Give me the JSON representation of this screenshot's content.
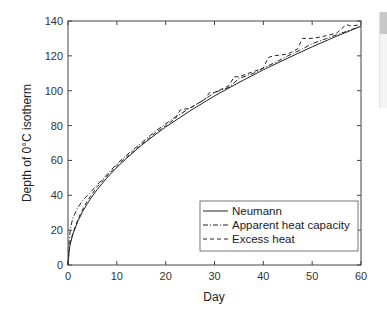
{
  "chart_data": {
    "type": "line",
    "title": "",
    "xlabel": "Day",
    "ylabel": "Depth of 0°C isotherm",
    "xlim": [
      0,
      60
    ],
    "ylim": [
      0,
      140
    ],
    "xticks": [
      0,
      10,
      20,
      30,
      40,
      50,
      60
    ],
    "yticks": [
      0,
      20,
      40,
      60,
      80,
      100,
      120,
      140
    ],
    "grid": false,
    "legend_position": "lower right",
    "series": [
      {
        "name": "Neumann",
        "style": "solid",
        "x": [
          0,
          0.25,
          0.5,
          1,
          2,
          3,
          4,
          5,
          6,
          8,
          10,
          12,
          15,
          18,
          20,
          25,
          30,
          35,
          40,
          45,
          50,
          55,
          60
        ],
        "y": [
          0,
          8.9,
          12.5,
          17.7,
          25,
          30.7,
          35.4,
          39.6,
          43.4,
          50.1,
          56,
          61.3,
          68.6,
          75.1,
          79.2,
          88.5,
          97,
          104.7,
          112,
          118.7,
          125.2,
          131.3,
          137
        ]
      },
      {
        "name": "Apparent heat capacity",
        "style": "dashdot",
        "x": [
          0,
          0.25,
          0.5,
          1,
          2,
          3,
          4,
          5,
          6,
          8,
          10,
          12,
          15,
          18,
          20,
          22,
          25,
          28,
          30,
          33,
          35,
          38,
          40,
          43,
          45,
          48,
          50,
          53,
          55,
          58,
          60
        ],
        "y": [
          0,
          14,
          21,
          27,
          33,
          37,
          40,
          43,
          46,
          52,
          58,
          63,
          70,
          77,
          81,
          85,
          90,
          95,
          99,
          102,
          107,
          110,
          113,
          117,
          120,
          124,
          127,
          130,
          132,
          135,
          137
        ]
      },
      {
        "name": "Excess heat",
        "style": "dashed",
        "x": [
          0,
          0.25,
          0.5,
          1,
          2,
          3,
          4,
          5,
          6,
          8,
          10,
          12,
          15,
          18,
          20,
          22,
          23,
          25,
          28,
          29,
          30,
          33,
          34,
          35,
          38,
          40,
          41,
          42,
          45,
          47,
          48,
          50,
          52,
          55,
          57,
          58,
          60
        ],
        "y": [
          0,
          9,
          13,
          18.5,
          26,
          32,
          37,
          41,
          45,
          51,
          57,
          62,
          69,
          76,
          80,
          84,
          89,
          90,
          95,
          99,
          99,
          103,
          108,
          108,
          111,
          113,
          119,
          120,
          121,
          124,
          130,
          130,
          131,
          133,
          138,
          137,
          138
        ]
      }
    ]
  },
  "axes": {
    "x_title": "Day",
    "y_title": "Depth of 0°C isotherm",
    "x_tick_labels": [
      "0",
      "10",
      "20",
      "30",
      "40",
      "50",
      "60"
    ],
    "y_tick_labels": [
      "0",
      "20",
      "40",
      "60",
      "80",
      "100",
      "120",
      "140"
    ]
  },
  "legend": {
    "items": [
      "Neumann",
      "Apparent heat capacity",
      "Excess heat"
    ]
  }
}
